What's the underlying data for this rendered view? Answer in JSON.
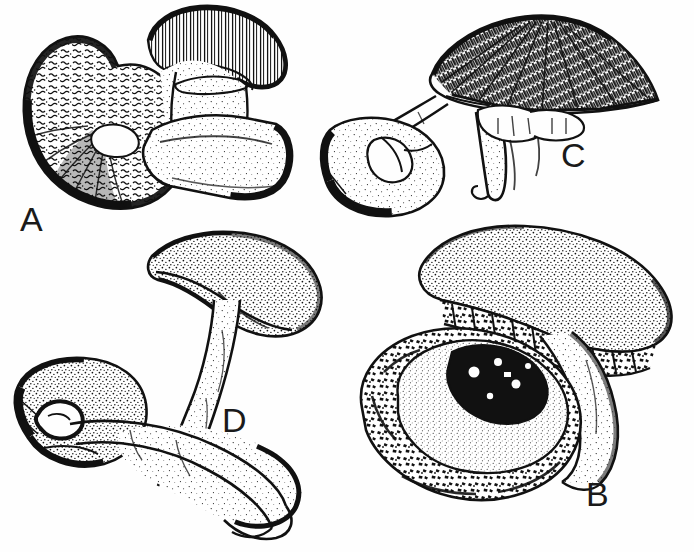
{
  "plate": {
    "title": "Mushroom identification plate",
    "medium": "pen-and-ink line drawing",
    "background_color": "#fefefe",
    "ink_color": "#111111",
    "width": 694,
    "height": 552
  },
  "figures": [
    {
      "id": "A",
      "label": "A",
      "label_position": {
        "x": 20,
        "y": 202
      },
      "description": "Cluster of three fruiting bodies: a large cap shown from above at left with coarsely scaly stippled surface and dark rim, a smaller striate cap at upper right, and a thick club-shaped stipe lying horizontally across the lower right."
    },
    {
      "id": "C",
      "label": "C",
      "label_position": {
        "x": 561,
        "y": 138
      },
      "description": "Two fruiting bodies: a broad conical dark fibrillose cap at upper right with a long tapering ringed stipe hanging below, and a smaller cap in side view at the left with a short stipe."
    },
    {
      "id": "D",
      "label": "D",
      "label_position": {
        "x": 222,
        "y": 403
      },
      "description": "Two fruiting bodies: an upper tilted convex cap on a long curved stipe, and a lower inverted cap at left whose stipe sweeps right and curves downward with a swollen base."
    },
    {
      "id": "B",
      "label": "B",
      "label_position": {
        "x": 586,
        "y": 477
      },
      "description": "Two stout fruiting bodies: an upper convex cap seen from the side with a thick stipe, and a lower cap viewed from above showing a dark depressed centre and a heavily spotted outer zone."
    }
  ],
  "colors": {
    "ink": "#111111",
    "paper": "#fefefe",
    "label_text": "#1a1a1a"
  }
}
